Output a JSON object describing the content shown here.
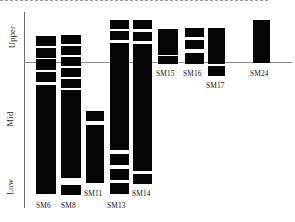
{
  "figure": {
    "type": "stratigraphic-column-chart",
    "background": "#ffffff",
    "bar_color": "#050505",
    "axis_color": "#6d6d6d"
  },
  "axis": {
    "zones": [
      {
        "name": "zone-upper",
        "label": "Upper"
      },
      {
        "name": "zone-mid",
        "label": "Mid"
      },
      {
        "name": "zone-low",
        "label": "Low"
      }
    ],
    "reference_lines": [
      {
        "name": "upper-mid-boundary",
        "style": "solid",
        "y": 62
      },
      {
        "name": "mid-low-boundary",
        "style": "dashed",
        "y": 180
      }
    ]
  },
  "chart_data": {
    "type": "bar",
    "title": "",
    "xlabel": "",
    "ylabel": "",
    "orientation": "vertical",
    "grid": false,
    "legend": false,
    "zone_labels": [
      "Upper",
      "Mid",
      "Low"
    ],
    "zone_boundaries_px": [
      62,
      180
    ],
    "categories": [
      "SM6",
      "SM8",
      "SM11",
      "SM13",
      "SM14",
      "SM15",
      "SM16",
      "SM17",
      "SM24"
    ],
    "series": [
      {
        "name": "SM6",
        "label": "SM6",
        "label_x": 36,
        "label_y": 200,
        "x": 36,
        "width": 20,
        "segments": [
          {
            "top": 35,
            "height": 10
          },
          {
            "top": 47,
            "height": 10
          },
          {
            "top": 58,
            "height": 11
          },
          {
            "top": 71,
            "height": 10
          },
          {
            "top": 84,
            "height": 109
          }
        ]
      },
      {
        "name": "SM8",
        "label": "SM8",
        "label_x": 61,
        "label_y": 200,
        "x": 61,
        "width": 20,
        "segments": [
          {
            "top": 34,
            "height": 9
          },
          {
            "top": 45,
            "height": 9
          },
          {
            "top": 56,
            "height": 9
          },
          {
            "top": 67,
            "height": 9
          },
          {
            "top": 78,
            "height": 9
          },
          {
            "top": 89,
            "height": 88
          },
          {
            "top": 184,
            "height": 10
          }
        ]
      },
      {
        "name": "SM11",
        "label": "SM11",
        "label_x": 84,
        "label_y": 188,
        "x": 86,
        "width": 18,
        "segments": [
          {
            "top": 110,
            "height": 10
          },
          {
            "top": 124,
            "height": 58
          }
        ]
      },
      {
        "name": "SM13",
        "label": "SM13",
        "label_x": 107,
        "label_y": 200,
        "x": 110,
        "width": 19,
        "segments": [
          {
            "top": 19,
            "height": 9
          },
          {
            "top": 30,
            "height": 9
          },
          {
            "top": 42,
            "height": 107
          },
          {
            "top": 153,
            "height": 11
          },
          {
            "top": 168,
            "height": 11
          },
          {
            "top": 182,
            "height": 11
          }
        ]
      },
      {
        "name": "SM14",
        "label": "SM14",
        "label_x": 132,
        "label_y": 188,
        "x": 133,
        "width": 19,
        "segments": [
          {
            "top": 19,
            "height": 9
          },
          {
            "top": 31,
            "height": 9
          },
          {
            "top": 43,
            "height": 127
          },
          {
            "top": 173,
            "height": 10
          }
        ]
      },
      {
        "name": "SM15",
        "label": "SM15",
        "label_x": 156,
        "label_y": 68,
        "x": 158,
        "width": 20,
        "segments": [
          {
            "top": 28,
            "height": 26
          },
          {
            "top": 55,
            "height": 8
          }
        ]
      },
      {
        "name": "SM16",
        "label": "SM16",
        "label_x": 183,
        "label_y": 68,
        "x": 185,
        "width": 19,
        "segments": [
          {
            "top": 27,
            "height": 9
          },
          {
            "top": 39,
            "height": 9
          },
          {
            "top": 52,
            "height": 11
          }
        ]
      },
      {
        "name": "SM17",
        "label": "SM17",
        "label_x": 206,
        "label_y": 80,
        "x": 208,
        "width": 17,
        "segments": [
          {
            "top": 27,
            "height": 36
          },
          {
            "top": 65,
            "height": 10
          }
        ]
      },
      {
        "name": "SM24",
        "label": "SM24",
        "label_x": 250,
        "label_y": 68,
        "x": 253,
        "width": 17,
        "segments": [
          {
            "top": 19,
            "height": 43
          }
        ]
      }
    ]
  }
}
